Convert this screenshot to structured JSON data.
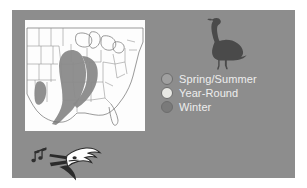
{
  "figure": {
    "background_color": "#ffffff",
    "panel_color": "#8d8d8d",
    "map_background_color": "#fdfdfd"
  },
  "map": {
    "title": "",
    "region": "Eastern United States",
    "range_shading_color": "#8a8a8a",
    "outline_color": "#6e6e6e",
    "shaded_areas": [
      "Mississippi River Valley",
      "Lower Mississippi / Gulf Coast",
      "Central Texas"
    ]
  },
  "goose": {
    "icon": "goose-silhouette-icon",
    "color": "#4a4a4a"
  },
  "songbird": {
    "icon": "singing-bird-head-icon",
    "notes_icon": "music-notes-icon",
    "color": "#2f2f2f"
  },
  "legend": {
    "items": [
      {
        "label": "Spring/Summer",
        "color": "#a0a0a0"
      },
      {
        "label": "Year-Round",
        "color": "#e8e8e4"
      },
      {
        "label": "Winter",
        "color": "#7a7a7a"
      }
    ]
  }
}
